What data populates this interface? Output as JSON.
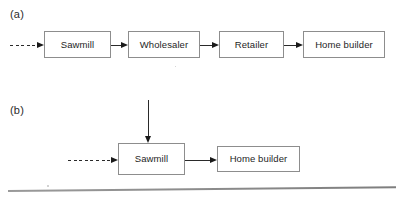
{
  "figure": {
    "width": 399,
    "height": 198,
    "background": "#ffffff",
    "line_color": "#2a2a2a",
    "box_border_color": "#8d8d8d",
    "text_color": "#1e1e1e"
  },
  "panels": [
    {
      "id": "a",
      "label": "(a)",
      "label_x": 10,
      "label_y": 9,
      "nodes": [
        {
          "id": "a-sawmill",
          "label": "Sawmill",
          "x": 44,
          "y": 31,
          "w": 67,
          "h": 27
        },
        {
          "id": "a-wholesaler",
          "label": "Wholesaler",
          "x": 128,
          "y": 31,
          "w": 72,
          "h": 27
        },
        {
          "id": "a-retailer",
          "label": "Retailer",
          "x": 219,
          "y": 31,
          "w": 65,
          "h": 27
        },
        {
          "id": "a-home-builder",
          "label": "Home builder",
          "x": 303,
          "y": 31,
          "w": 82,
          "h": 27
        }
      ],
      "edges": [
        {
          "id": "a-edge-input",
          "style": "dashed",
          "orientation": "horizontal",
          "x1": 10,
          "y1": 45,
          "x2": 44,
          "y2": 45,
          "arrow": "end"
        },
        {
          "id": "a-edge-sawmill-wholesaler",
          "style": "solid",
          "orientation": "horizontal",
          "x1": 111,
          "y1": 45,
          "x2": 128,
          "y2": 45,
          "arrow": "end"
        },
        {
          "id": "a-edge-wholesaler-retailer",
          "style": "solid",
          "orientation": "horizontal",
          "x1": 200,
          "y1": 45,
          "x2": 219,
          "y2": 45,
          "arrow": "end"
        },
        {
          "id": "a-edge-retailer-homebuilder",
          "style": "solid",
          "orientation": "horizontal",
          "x1": 284,
          "y1": 45,
          "x2": 303,
          "y2": 45,
          "arrow": "end"
        }
      ]
    },
    {
      "id": "b",
      "label": "(b)",
      "label_x": 10,
      "label_y": 105,
      "nodes": [
        {
          "id": "b-sawmill",
          "label": "Sawmill",
          "x": 118,
          "y": 143,
          "w": 67,
          "h": 32
        },
        {
          "id": "b-home-builder",
          "label": "Home builder",
          "x": 217,
          "y": 146,
          "w": 83,
          "h": 26
        }
      ],
      "edges": [
        {
          "id": "b-edge-top-input",
          "style": "solid",
          "orientation": "vertical",
          "x1": 148,
          "y1": 100,
          "x2": 148,
          "y2": 143,
          "arrow": "end"
        },
        {
          "id": "b-edge-input",
          "style": "dashed",
          "orientation": "horizontal",
          "x1": 68,
          "y1": 160,
          "x2": 118,
          "y2": 160,
          "arrow": "end"
        },
        {
          "id": "b-edge-sawmill-homebuilder",
          "style": "solid",
          "orientation": "horizontal",
          "x1": 185,
          "y1": 160,
          "x2": 217,
          "y2": 160,
          "arrow": "end"
        }
      ]
    }
  ],
  "baseline_rule": {
    "id": "baseline-rule",
    "x": 8,
    "y": 190,
    "width": 388,
    "thickness": 1.6,
    "rotation_deg": -0.55
  },
  "specks": [
    {
      "x": 47,
      "y": 185,
      "size": 1.6
    },
    {
      "x": 175,
      "y": 66,
      "size": 1.3
    }
  ]
}
